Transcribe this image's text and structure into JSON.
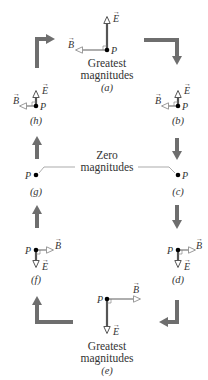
{
  "colors": {
    "e_field": "#555555",
    "b_field": "#9a9a9a",
    "cycle_arrow": "#6e6e6e",
    "text": "#333333",
    "point": "#000000"
  },
  "symbols": {
    "point": "P",
    "e_vector": "E",
    "b_vector": "B"
  },
  "captions": {
    "greatest_line1": "Greatest",
    "greatest_line2": "magnitudes",
    "zero_line1": "Zero",
    "zero_line2": "magnitudes"
  },
  "panels": [
    {
      "id": "a",
      "label": "(a)",
      "e_direction": "up",
      "b_direction": "left",
      "magnitude": "greatest"
    },
    {
      "id": "b",
      "label": "(b)",
      "e_direction": "up",
      "b_direction": "left",
      "magnitude": "reduced"
    },
    {
      "id": "c",
      "label": "(c)",
      "e_direction": "none",
      "b_direction": "none",
      "magnitude": "zero"
    },
    {
      "id": "d",
      "label": "(d)",
      "e_direction": "down",
      "b_direction": "right",
      "magnitude": "reduced"
    },
    {
      "id": "e",
      "label": "(e)",
      "e_direction": "down",
      "b_direction": "right",
      "magnitude": "greatest"
    },
    {
      "id": "f",
      "label": "(f)",
      "e_direction": "down",
      "b_direction": "right",
      "magnitude": "reduced"
    },
    {
      "id": "g",
      "label": "(g)",
      "e_direction": "none",
      "b_direction": "none",
      "magnitude": "zero"
    },
    {
      "id": "h",
      "label": "(h)",
      "e_direction": "up",
      "b_direction": "left",
      "magnitude": "reduced"
    }
  ],
  "cycle_direction": "clockwise"
}
